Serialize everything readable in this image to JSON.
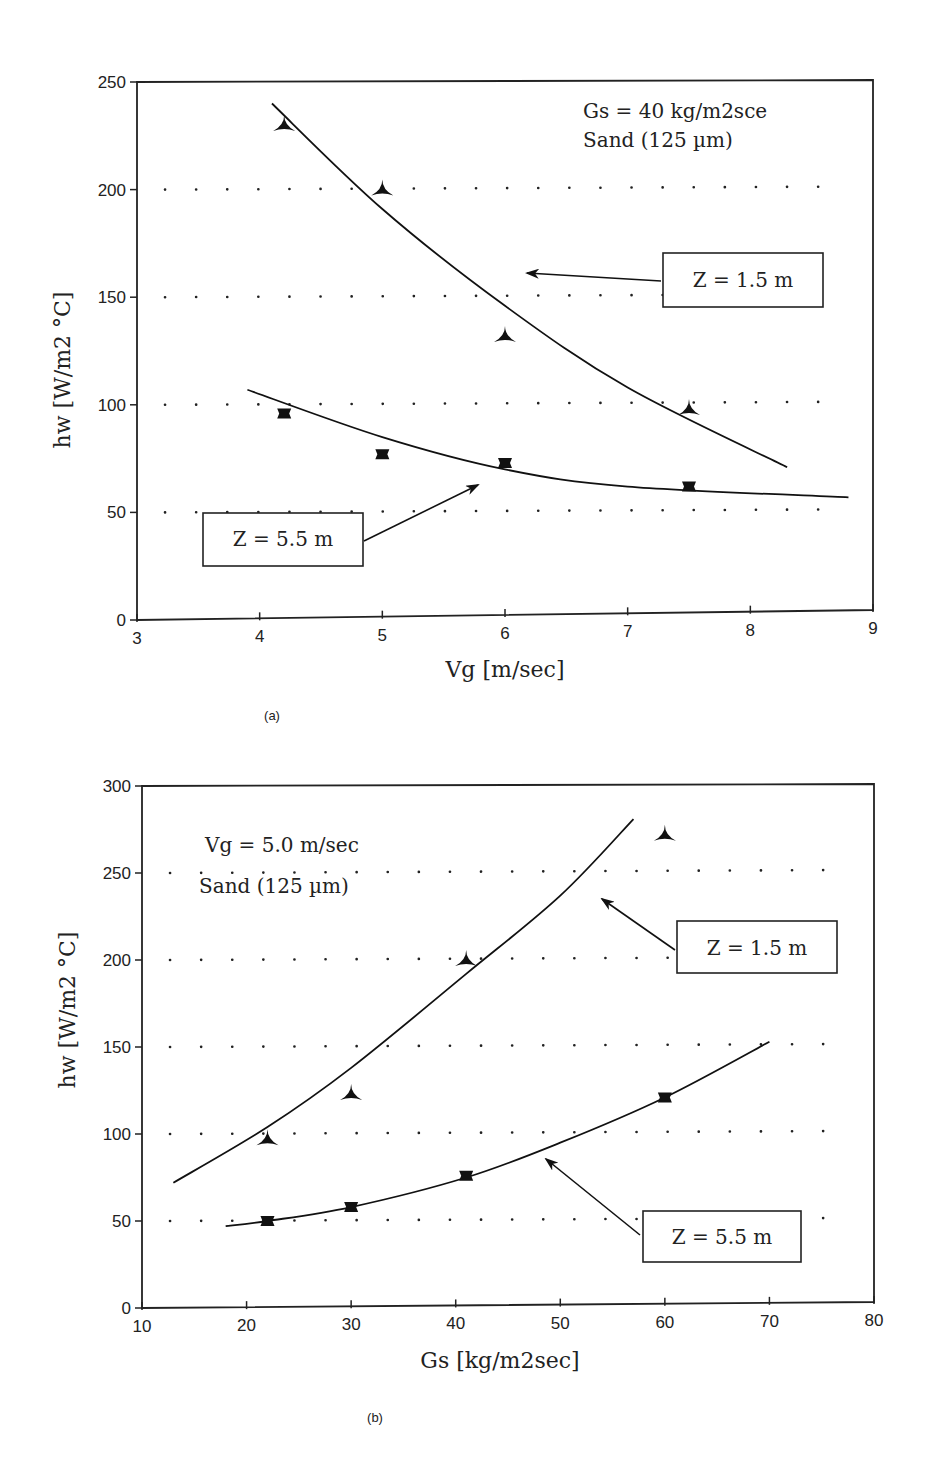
{
  "chart_data": [
    {
      "type": "line",
      "panel": "(a)",
      "title": "",
      "xlabel": "Vg [m/sec]",
      "ylabel": "hw [W/m2 °C]",
      "xlim": [
        3,
        9
      ],
      "ylim": [
        0,
        250
      ],
      "xticks": [
        "3",
        "4",
        "5",
        "6",
        "7",
        "8",
        "9"
      ],
      "yticks": [
        "0",
        "50",
        "100",
        "150",
        "200",
        "250"
      ],
      "grid": "dotted horizontal",
      "annotations": [
        "Gs = 40 kg/m2sce",
        "Sand (125 µm)"
      ],
      "series": [
        {
          "name": "Z = 1.5 m",
          "marker": "triangle",
          "points_x": [
            4.2,
            5,
            6,
            7.5
          ],
          "points_y": [
            230,
            200,
            132,
            98
          ],
          "fit_x": [
            4.1,
            5,
            6,
            7,
            8.3
          ],
          "fit_y": [
            240,
            191,
            146,
            108,
            71
          ]
        },
        {
          "name": "Z = 5.5 m",
          "marker": "square",
          "points_x": [
            4.2,
            5,
            6,
            7.5
          ],
          "points_y": [
            96,
            77,
            73,
            62
          ],
          "fit_x": [
            3.9,
            5,
            6,
            7,
            8.8
          ],
          "fit_y": [
            107,
            85,
            70,
            62,
            57
          ]
        }
      ]
    },
    {
      "type": "line",
      "panel": "(b)",
      "title": "",
      "xlabel": "Gs [kg/m2sec]",
      "ylabel": "hw [W/m2 °C]",
      "xlim": [
        10,
        80
      ],
      "ylim": [
        0,
        300
      ],
      "xticks": [
        "10",
        "20",
        "30",
        "40",
        "50",
        "60",
        "70",
        "80"
      ],
      "yticks": [
        "0",
        "50",
        "100",
        "150",
        "200",
        "250",
        "300"
      ],
      "grid": "dotted horizontal",
      "annotations": [
        "Vg = 5.0 m/sec",
        "Sand (125 µm)"
      ],
      "series": [
        {
          "name": "Z = 1.5 m",
          "marker": "triangle",
          "points_x": [
            22,
            30,
            41,
            60
          ],
          "points_y": [
            97,
            123,
            200,
            272
          ],
          "fit_x": [
            13,
            22,
            30,
            41,
            50,
            57
          ],
          "fit_y": [
            72,
            104,
            138,
            192,
            237,
            281
          ]
        },
        {
          "name": "Z = 5.5 m",
          "marker": "square",
          "points_x": [
            22,
            30,
            41,
            60
          ],
          "points_y": [
            50,
            58,
            76,
            121
          ],
          "fit_x": [
            18,
            22,
            30,
            41,
            50,
            60,
            70
          ],
          "fit_y": [
            47,
            50,
            58,
            75,
            95,
            121,
            153
          ]
        }
      ]
    }
  ],
  "panel_a": {
    "ylabel": "hw [W/m2 °C]",
    "xlabel": "Vg [m/sec]",
    "annotation_line1": "Gs = 40 kg/m2sce",
    "annotation_line2": "Sand (125 µm)",
    "label_z15": "Z = 1.5 m",
    "label_z55": "Z = 5.5 m",
    "caption": "(a)"
  },
  "panel_b": {
    "ylabel": "hw [W/m2 °C]",
    "xlabel": "Gs [kg/m2sec]",
    "annotation_line1": "Vg = 5.0 m/sec",
    "annotation_line2": "Sand (125 µm)",
    "label_z15": "Z = 1.5 m",
    "label_z55": "Z = 5.5 m",
    "caption": "(b)"
  }
}
